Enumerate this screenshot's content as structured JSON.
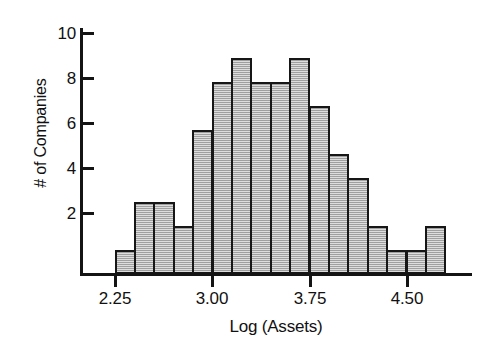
{
  "figure": {
    "kind": "statistical-histogram",
    "background": "#ffffff",
    "bar_fill_color": "#b4b4b4",
    "bar_edge_color": "#161616",
    "axis_color": "#141414"
  },
  "axes": {
    "x_title": "Log (Assets)",
    "y_title": "# of Companies",
    "x_tick_labels": [
      "2.25",
      "3.00",
      "3.75",
      "4.50"
    ],
    "y_tick_labels": [
      "2",
      "4",
      "6",
      "8",
      "10"
    ]
  },
  "chart_data": {
    "type": "bar",
    "title": "",
    "subtitle": "",
    "xlabel": "Log (Assets)",
    "ylabel": "# of Companies",
    "grid": false,
    "legend": null,
    "legend_position": "none",
    "xlim": [
      2.1,
      4.95
    ],
    "ylim": [
      0,
      10.6
    ],
    "xticks": [
      2.25,
      3.0,
      3.75,
      4.5
    ],
    "xticklabels": [
      "2.25",
      "3.00",
      "3.75",
      "4.50"
    ],
    "yticks": [
      2,
      4,
      6,
      8,
      10
    ],
    "yticklabels": [
      "2",
      "4",
      "6",
      "8",
      "10"
    ],
    "bin_width": 0.15,
    "bin_start": 2.25,
    "bin_edges": [
      2.25,
      2.4,
      2.55,
      2.7,
      2.85,
      3.0,
      3.15,
      3.3,
      3.45,
      3.6,
      3.75,
      3.9,
      4.05,
      4.2,
      4.35,
      4.5,
      4.65,
      4.8
    ],
    "bin_centers": [
      2.325,
      2.475,
      2.625,
      2.775,
      2.925,
      3.075,
      3.225,
      3.375,
      3.525,
      3.675,
      3.825,
      3.975,
      4.125,
      4.275,
      4.425,
      4.575,
      4.725
    ],
    "categories": [
      "2.25-2.40",
      "2.40-2.55",
      "2.55-2.70",
      "2.70-2.85",
      "2.85-3.00",
      "3.00-3.15",
      "3.15-3.30",
      "3.30-3.45",
      "3.45-3.60",
      "3.60-3.75",
      "3.75-3.90",
      "3.90-4.05",
      "4.05-4.20",
      "4.20-4.35",
      "4.35-4.50",
      "4.50-4.65",
      "4.65-4.80"
    ],
    "values": [
      1,
      3,
      3,
      2,
      6,
      8,
      9,
      8,
      8,
      9,
      7,
      5,
      4,
      2,
      1,
      1,
      2
    ],
    "total_count": 79
  }
}
